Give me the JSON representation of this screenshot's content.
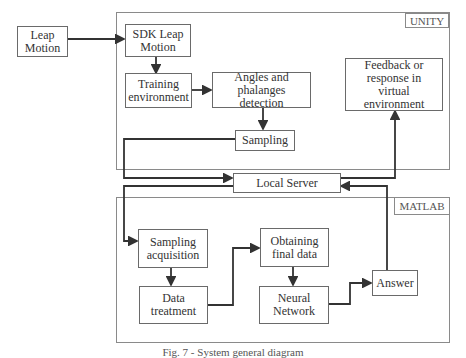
{
  "diagram": {
    "external": {
      "leap_motion": "Leap Motion"
    },
    "unity": {
      "label": "UNITY",
      "nodes": {
        "sdk": "SDK Leap Motion",
        "training": "Training environment",
        "angles": "Angles and phalanges detection",
        "sampling": "Sampling",
        "feedback": "Feedback or response in virtual environment"
      }
    },
    "server": {
      "label": "Local Server"
    },
    "matlab": {
      "label": "MATLAB",
      "nodes": {
        "acquisition": "Sampling acquisition",
        "treatment": "Data treatment",
        "final_data": "Obtaining final data",
        "neural": "Neural Network",
        "answer": "Answer"
      }
    },
    "edges": [
      [
        "Leap Motion",
        "SDK Leap Motion"
      ],
      [
        "SDK Leap Motion",
        "Training environment"
      ],
      [
        "Training environment",
        "Angles and phalanges detection"
      ],
      [
        "Angles and phalanges detection",
        "Sampling"
      ],
      [
        "Sampling",
        "Local Server"
      ],
      [
        "Local Server",
        "Sampling acquisition"
      ],
      [
        "Sampling acquisition",
        "Data treatment"
      ],
      [
        "Data treatment",
        "Obtaining final data"
      ],
      [
        "Obtaining final data",
        "Neural Network"
      ],
      [
        "Neural Network",
        "Answer"
      ],
      [
        "Answer",
        "Local Server"
      ],
      [
        "Local Server",
        "Feedback or response in virtual environment"
      ]
    ],
    "caption": "Fig. 7 - System general diagram"
  }
}
